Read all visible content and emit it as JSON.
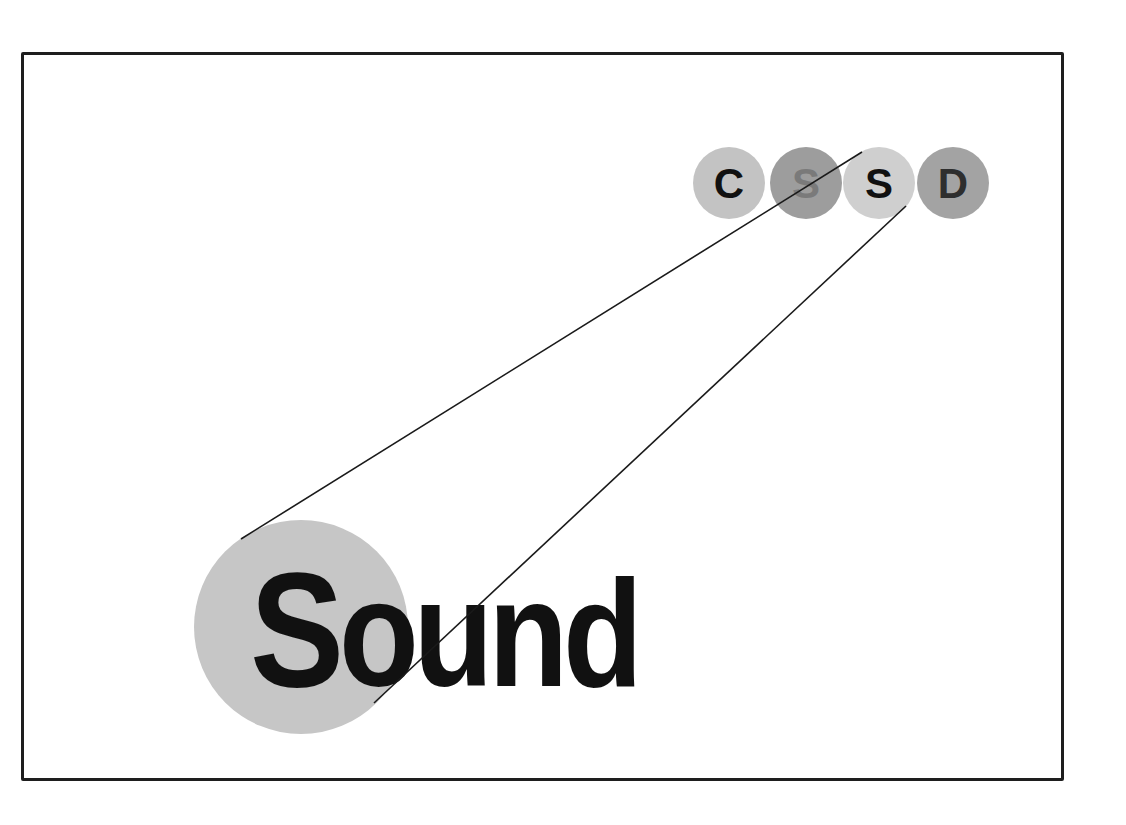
{
  "diagram": {
    "word": {
      "first_letter": "S",
      "rest": "ound",
      "full": "Sound"
    },
    "acronym_circles": [
      {
        "letter": "C",
        "cx": 729,
        "cy": 183,
        "r": 36,
        "fill": "#c3c3c3",
        "text_color": "#111111"
      },
      {
        "letter": "S",
        "cx": 806,
        "cy": 183,
        "r": 36,
        "fill": "#9d9d9d",
        "text_color": "#7a7a7a"
      },
      {
        "letter": "S",
        "cx": 879,
        "cy": 183,
        "r": 36,
        "fill": "#cfcfcf",
        "text_color": "#111111"
      },
      {
        "letter": "D",
        "cx": 953,
        "cy": 183,
        "r": 36,
        "fill": "#a3a3a3",
        "text_color": "#2e2e2e"
      }
    ],
    "big_circle": {
      "cx": 301,
      "cy": 627,
      "r": 107,
      "fill": "#c6c6c6"
    },
    "connector_lines": [
      {
        "x1": 241,
        "y1": 539,
        "x2": 862,
        "y2": 152
      },
      {
        "x1": 374,
        "y1": 703,
        "x2": 906,
        "y2": 206
      }
    ],
    "colors": {
      "frame": "#1e1e1e",
      "line": "#1a1a1a",
      "background": "#ffffff"
    }
  }
}
